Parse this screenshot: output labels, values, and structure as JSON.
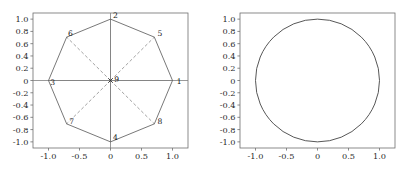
{
  "figure": {
    "width": 413,
    "height": 175,
    "background": "#ffffff",
    "panel_count": 2
  },
  "style": {
    "axis_color": "#808080",
    "spine_color": "#6e6e6e",
    "edge_color": "#555555",
    "dashed_color": "#8a8a8a",
    "circle_color": "#444444",
    "tick_text_color": "#2a2a2a",
    "node_text_color": "#1a1a1a",
    "marker_color": "#333333"
  },
  "chart_data": [
    {
      "type": "scatter",
      "title": "",
      "xlabel": "",
      "ylabel": "",
      "xlim": [
        -1.25,
        1.25
      ],
      "ylim": [
        -1.1,
        1.1
      ],
      "grid": false,
      "legend": "none",
      "xticks": [
        -1.0,
        -0.5,
        0,
        0.5,
        1.0
      ],
      "xticklabels": [
        "-1.0",
        "-0.5",
        "0",
        "0.5",
        "1.0"
      ],
      "yticks": [
        -1.0,
        -0.8,
        -0.6,
        -0.4,
        -0.2,
        0,
        0.2,
        0.4,
        0.6,
        0.8,
        1.0
      ],
      "yticklabels": [
        "-1.0",
        "-0.8",
        "-0.6",
        "-0.4",
        "-0.2",
        "0",
        "0.2",
        "0.4",
        "0.6",
        "0.8",
        "1.0"
      ],
      "nodes": [
        {
          "id": "1",
          "x": 1.0,
          "y": 0.0,
          "label": "1",
          "label_dx": 0.07,
          "label_dy": 0.0
        },
        {
          "id": "2",
          "x": 0.0,
          "y": 1.0,
          "label": "2",
          "label_dx": 0.04,
          "label_dy": 0.06
        },
        {
          "id": "3",
          "x": -1.0,
          "y": 0.0,
          "label": "3",
          "label_dx": 0.03,
          "label_dy": -0.02
        },
        {
          "id": "4",
          "x": 0.0,
          "y": -1.0,
          "label": "4",
          "label_dx": 0.04,
          "label_dy": 0.08
        },
        {
          "id": "5",
          "x": 0.707,
          "y": 0.707,
          "label": "5",
          "label_dx": 0.05,
          "label_dy": 0.06
        },
        {
          "id": "6",
          "x": -0.707,
          "y": 0.707,
          "label": "6",
          "label_dx": 0.02,
          "label_dy": 0.07
        },
        {
          "id": "7",
          "x": -0.707,
          "y": -0.707,
          "label": "7",
          "label_dx": 0.04,
          "label_dy": 0.04
        },
        {
          "id": "8",
          "x": 0.707,
          "y": -0.707,
          "label": "8",
          "label_dx": 0.05,
          "label_dy": 0.04
        },
        {
          "id": "9",
          "x": 0.0,
          "y": 0.0,
          "label": "9",
          "label_dx": 0.06,
          "label_dy": 0.02
        }
      ],
      "perimeter_edges": [
        [
          "2",
          "5"
        ],
        [
          "5",
          "1"
        ],
        [
          "1",
          "8"
        ],
        [
          "8",
          "4"
        ],
        [
          "4",
          "7"
        ],
        [
          "7",
          "3"
        ],
        [
          "3",
          "6"
        ],
        [
          "6",
          "2"
        ]
      ],
      "solid_spokes": [
        [
          "9",
          "1"
        ],
        [
          "9",
          "2"
        ],
        [
          "9",
          "3"
        ],
        [
          "9",
          "4"
        ]
      ],
      "dashed_spokes": [
        [
          "9",
          "5"
        ],
        [
          "9",
          "6"
        ],
        [
          "9",
          "7"
        ],
        [
          "9",
          "8"
        ]
      ],
      "center_marker": "x"
    },
    {
      "type": "line",
      "title": "",
      "xlabel": "",
      "ylabel": "",
      "xlim": [
        -1.25,
        1.25
      ],
      "ylim": [
        -1.1,
        1.1
      ],
      "grid": false,
      "legend": "none",
      "xticks": [
        -1.0,
        -0.5,
        0,
        0.5,
        1.0
      ],
      "xticklabels": [
        "-1.0",
        "-0.5",
        "0",
        "0.5",
        "1.0"
      ],
      "yticks": [
        -1.0,
        -0.8,
        -0.6,
        -0.4,
        -0.2,
        0,
        0.2,
        0.4,
        0.6,
        0.8,
        1.0
      ],
      "yticklabels": [
        "-1.0",
        "-0.8",
        "-0.6",
        "-0.4",
        "-0.2",
        "0",
        "0.2",
        "0.4",
        "0.6",
        "0.8",
        "1.0"
      ],
      "curve": {
        "name": "unit-circle",
        "shape": "circle",
        "cx": 0.0,
        "cy": 0.0,
        "r": 1.0
      }
    }
  ]
}
